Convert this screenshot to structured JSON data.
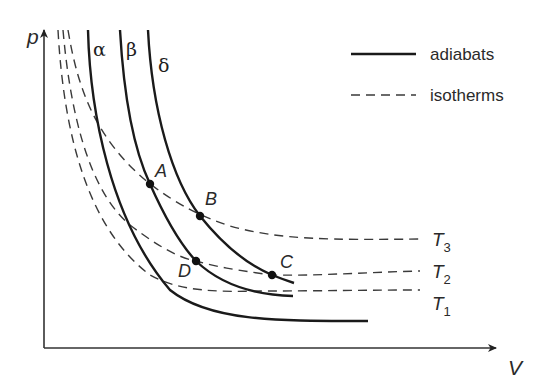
{
  "diagram": {
    "type": "p-V diagram (Carnot cycle)",
    "axes": {
      "y_label": "p",
      "x_label": "V"
    },
    "legend": [
      {
        "style": "solid",
        "label": "adiabats"
      },
      {
        "style": "dashed",
        "label": "isotherms"
      }
    ],
    "adiabats": [
      {
        "label": "α",
        "name": "alpha"
      },
      {
        "label": "β",
        "name": "beta"
      },
      {
        "label": "δ",
        "name": "delta"
      }
    ],
    "isotherms": [
      {
        "label": "T",
        "sub": "3"
      },
      {
        "label": "T",
        "sub": "2"
      },
      {
        "label": "T",
        "sub": "1"
      }
    ],
    "points": [
      {
        "label": "A",
        "on": "β ∩ T3"
      },
      {
        "label": "B",
        "on": "δ ∩ T3"
      },
      {
        "label": "C",
        "on": "δ ∩ T2"
      },
      {
        "label": "D",
        "on": "β ∩ T2"
      }
    ],
    "colors": {
      "line": "#1a1a1a",
      "dashed": "#3a3a3a",
      "axis": "#333333",
      "background": "#ffffff"
    }
  }
}
